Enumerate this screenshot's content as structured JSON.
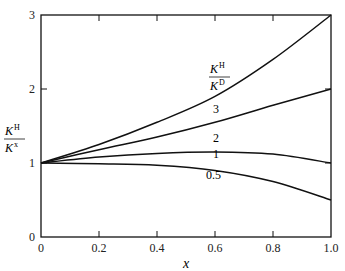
{
  "chart_data": {
    "type": "line",
    "title": "",
    "xlabel": "x",
    "ylabel": "K^H / K^x",
    "xlim": [
      0,
      1.0
    ],
    "ylim": [
      0,
      3
    ],
    "x_ticks": [
      "0",
      "0.2",
      "0.4",
      "0.6",
      "0.8",
      "1.0"
    ],
    "y_ticks": [
      "0",
      "1",
      "2",
      "3"
    ],
    "legend_title": "K^H / K^D",
    "x": [
      0,
      0.2,
      0.4,
      0.6,
      0.8,
      1.0
    ],
    "series": [
      {
        "name": "3",
        "values": [
          1.0,
          1.25,
          1.55,
          1.9,
          2.4,
          3.0
        ]
      },
      {
        "name": "2",
        "values": [
          1.0,
          1.18,
          1.35,
          1.55,
          1.78,
          2.0
        ]
      },
      {
        "name": "1",
        "values": [
          1.0,
          1.08,
          1.13,
          1.15,
          1.12,
          1.0
        ]
      },
      {
        "name": "0.5",
        "values": [
          1.0,
          0.99,
          0.97,
          0.9,
          0.75,
          0.5
        ]
      }
    ],
    "grid": false
  }
}
